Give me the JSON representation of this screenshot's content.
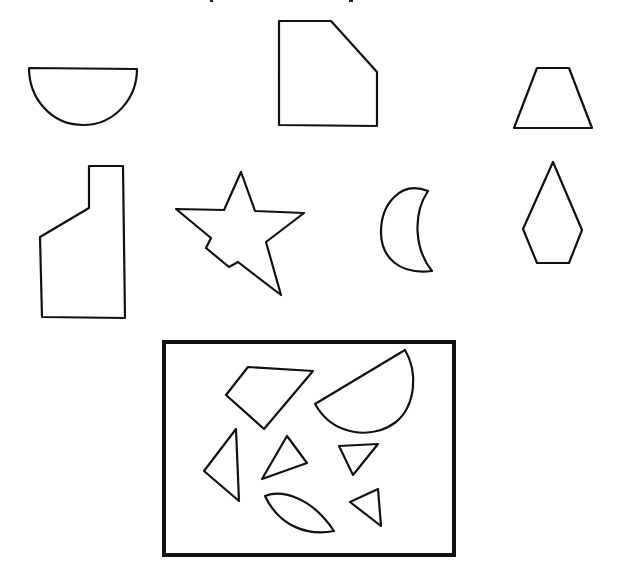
{
  "figure": {
    "stroke_color": "#111111",
    "background_color": "#ffffff",
    "reference_shapes": [
      {
        "id": "semicircle",
        "label": "Semicircle"
      },
      {
        "id": "cut-corner-pentagon",
        "label": "Pentagon with a cut corner"
      },
      {
        "id": "trapezoid",
        "label": "Trapezoid"
      },
      {
        "id": "stepped-column",
        "label": "Stepped column shape"
      },
      {
        "id": "notched-star",
        "label": "Five-pointed star with a notch"
      },
      {
        "id": "crescent",
        "label": "Crescent"
      },
      {
        "id": "kite-pentagon",
        "label": "Kite-shaped pentagon"
      }
    ],
    "pieces_box": {
      "label": "Pieces",
      "pieces": [
        {
          "id": "quadrilateral",
          "label": "Quadrilateral"
        },
        {
          "id": "tilted-semicircle",
          "label": "Tilted semicircle"
        },
        {
          "id": "left-triangle",
          "label": "Triangle"
        },
        {
          "id": "middle-triangle",
          "label": "Triangle"
        },
        {
          "id": "small-inverted-triangle",
          "label": "Small triangle"
        },
        {
          "id": "lens",
          "label": "Lens shape"
        },
        {
          "id": "small-triangle",
          "label": "Small triangle"
        }
      ]
    }
  }
}
